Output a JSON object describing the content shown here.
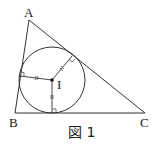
{
  "figure": {
    "caption": "図 1",
    "points": {
      "A": {
        "label": "A",
        "x": 29,
        "y": 20
      },
      "B": {
        "label": "B",
        "x": 15,
        "y": 113
      },
      "C": {
        "label": "C",
        "x": 145,
        "y": 113
      },
      "I": {
        "label": "I",
        "x": 52,
        "y": 80
      }
    },
    "incircle": {
      "cx": 52,
      "cy": 80,
      "r": 33
    },
    "tangent_points": {
      "on_AB": {
        "x": 20,
        "y": 76
      },
      "on_BC": {
        "x": 52,
        "y": 113
      },
      "on_AC": {
        "x": 72,
        "y": 56
      }
    },
    "line_color": "#333333"
  }
}
